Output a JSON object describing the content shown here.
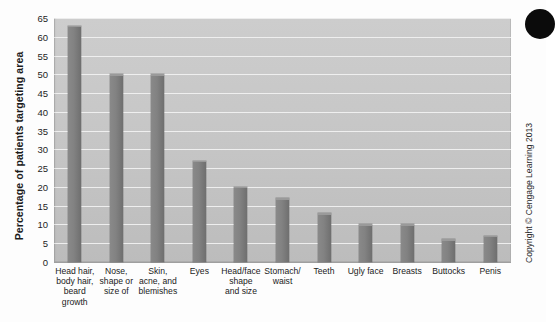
{
  "chart_data": {
    "type": "bar",
    "title": "",
    "xlabel": "",
    "ylabel": "Percentage of patients targeting area",
    "ylim": [
      0,
      65
    ],
    "ytick_step": 5,
    "yticks": [
      65,
      60,
      55,
      50,
      45,
      40,
      35,
      30,
      25,
      20,
      15,
      10,
      5,
      0
    ],
    "grid": true,
    "legend": "none",
    "categories": [
      "Head hair, body hair, beard growth",
      "Nose, shape or size of",
      "Skin, acne, and blemishes",
      "Eyes",
      "Head/face shape and size",
      "Stomach/ waist",
      "Teeth",
      "Ugly face",
      "Breasts",
      "Buttocks",
      "Penis"
    ],
    "category_lines": [
      [
        "Head hair,",
        "body hair,",
        "beard",
        "growth"
      ],
      [
        "Nose,",
        "shape or",
        "size of"
      ],
      [
        "Skin,",
        "acne, and",
        "blemishes"
      ],
      [
        "Eyes"
      ],
      [
        "Head/face",
        "shape",
        "and size"
      ],
      [
        "Stomach/",
        "waist"
      ],
      [
        "Teeth"
      ],
      [
        "Ugly face"
      ],
      [
        "Breasts"
      ],
      [
        "Buttocks"
      ],
      [
        "Penis"
      ]
    ],
    "values": [
      63,
      50,
      50,
      27,
      20,
      17,
      13,
      10,
      10,
      6,
      7
    ],
    "bar_color": "#808080",
    "plot_background": "#c6c6c6",
    "gridline_color": "#f2f2f2"
  },
  "annotations": {
    "copyright": "Copyright © Cengage Learning 2013"
  },
  "icons": {
    "corner_dot": "filled-circle"
  }
}
